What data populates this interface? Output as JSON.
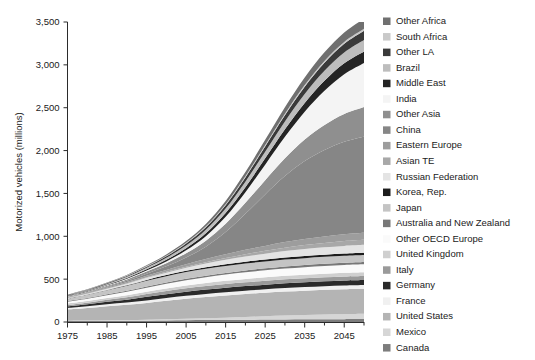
{
  "chart_data": {
    "type": "area",
    "title": "",
    "subtitle": "",
    "xlabel": "",
    "ylabel": "Motorized vehicles (millions)",
    "xlim": [
      1975,
      2050
    ],
    "ylim": [
      0,
      3500
    ],
    "grid": false,
    "legend_position": "right",
    "stacked": true,
    "x": [
      1975,
      1980,
      1985,
      1990,
      1995,
      2000,
      2005,
      2010,
      2015,
      2020,
      2025,
      2030,
      2035,
      2040,
      2045,
      2050
    ],
    "xticks": [
      1975,
      1985,
      1995,
      2005,
      2015,
      2025,
      2035,
      2045
    ],
    "xtick_labels": [
      "1975",
      "1985",
      "1995",
      "2005",
      "2015",
      "2025",
      "2035",
      "2045"
    ],
    "xminor_ticks": [
      1980,
      1990,
      2000,
      2010,
      2020,
      2030,
      2040,
      2050
    ],
    "yticks": [
      0,
      500,
      1000,
      1500,
      2000,
      2500,
      3000,
      3500
    ],
    "ytick_labels": [
      "0",
      "500",
      "1,000",
      "1,500",
      "2,000",
      "2,500",
      "3,000",
      "3,500"
    ],
    "total_top": [
      310,
      355,
      405,
      460,
      530,
      620,
      740,
      900,
      1120,
      1400,
      1720,
      2060,
      2400,
      2700,
      2950,
      3150
    ],
    "series": [
      {
        "name": "Canada",
        "color": "#7d7d7d",
        "values": [
          11,
          12,
          13,
          14,
          16,
          18,
          20,
          22,
          24,
          26,
          28,
          30,
          31,
          32,
          33,
          34
        ]
      },
      {
        "name": "Mexico",
        "color": "#d6d6d6",
        "values": [
          5,
          6,
          8,
          9,
          11,
          14,
          18,
          22,
          27,
          33,
          39,
          45,
          50,
          55,
          59,
          62
        ]
      },
      {
        "name": "United States",
        "color": "#b4b4b4",
        "values": [
          130,
          145,
          163,
          178,
          196,
          215,
          233,
          247,
          258,
          267,
          274,
          280,
          284,
          288,
          291,
          293
        ]
      },
      {
        "name": "France",
        "color": "#f0f0f0",
        "values": [
          17,
          20,
          23,
          26,
          29,
          32,
          34,
          36,
          38,
          39,
          40,
          41,
          42,
          42,
          43,
          43
        ]
      },
      {
        "name": "Germany",
        "color": "#2a2a2a",
        "values": [
          20,
          24,
          29,
          34,
          42,
          46,
          49,
          51,
          53,
          54,
          55,
          56,
          57,
          57,
          58,
          58
        ]
      },
      {
        "name": "Italy",
        "color": "#9a9a9a",
        "values": [
          16,
          19,
          23,
          27,
          32,
          36,
          39,
          41,
          43,
          44,
          45,
          46,
          46,
          47,
          47,
          47
        ]
      },
      {
        "name": "United Kingdom",
        "color": "#cfcfcf",
        "values": [
          16,
          18,
          21,
          24,
          27,
          30,
          33,
          35,
          37,
          39,
          40,
          41,
          42,
          43,
          43,
          44
        ]
      },
      {
        "name": "Other OECD Europe",
        "color": "#fafafa",
        "values": [
          22,
          27,
          33,
          40,
          47,
          55,
          62,
          68,
          73,
          78,
          82,
          85,
          88,
          90,
          92,
          93
        ]
      },
      {
        "name": "Australia and New Zealand",
        "color": "#787878",
        "values": [
          8,
          9,
          10,
          12,
          13,
          15,
          17,
          19,
          20,
          22,
          23,
          24,
          25,
          26,
          26,
          27
        ]
      },
      {
        "name": "Japan",
        "color": "#c4c4c4",
        "values": [
          28,
          38,
          48,
          58,
          68,
          73,
          77,
          79,
          80,
          80,
          80,
          80,
          80,
          80,
          80,
          80
        ]
      },
      {
        "name": "Korea, Rep.",
        "color": "#1c1c1c",
        "values": [
          1,
          2,
          3,
          6,
          10,
          13,
          16,
          18,
          20,
          22,
          23,
          24,
          25,
          25,
          26,
          26
        ]
      },
      {
        "name": "Russian Federation",
        "color": "#e4e4e4",
        "values": [
          7,
          10,
          14,
          19,
          24,
          29,
          36,
          44,
          52,
          60,
          68,
          75,
          81,
          86,
          90,
          93
        ]
      },
      {
        "name": "Asian TE",
        "color": "#a8a8a8",
        "values": [
          2,
          3,
          4,
          5,
          7,
          9,
          12,
          16,
          21,
          27,
          33,
          40,
          46,
          51,
          56,
          59
        ]
      },
      {
        "name": "Eastern Europe",
        "color": "#9d9d9d",
        "values": [
          6,
          8,
          11,
          14,
          18,
          23,
          29,
          36,
          43,
          51,
          58,
          65,
          71,
          76,
          80,
          83
        ]
      },
      {
        "name": "China",
        "color": "#868686",
        "values": [
          3,
          5,
          8,
          14,
          24,
          42,
          78,
          145,
          260,
          420,
          600,
          770,
          910,
          1010,
          1080,
          1120
        ]
      },
      {
        "name": "Other Asia",
        "color": "#8f8f8f",
        "values": [
          6,
          8,
          12,
          17,
          25,
          36,
          50,
          70,
          96,
          128,
          166,
          208,
          250,
          290,
          322,
          345
        ]
      },
      {
        "name": "India",
        "color": "#f4f4f4",
        "values": [
          2,
          3,
          5,
          8,
          13,
          21,
          33,
          52,
          82,
          125,
          182,
          250,
          325,
          400,
          465,
          515
        ]
      },
      {
        "name": "Middle East",
        "color": "#242424",
        "values": [
          3,
          4,
          6,
          9,
          13,
          18,
          25,
          34,
          45,
          58,
          73,
          88,
          103,
          116,
          127,
          135
        ]
      },
      {
        "name": "Brazil",
        "color": "#bdbdbd",
        "values": [
          5,
          7,
          10,
          13,
          18,
          24,
          31,
          40,
          51,
          64,
          78,
          92,
          105,
          117,
          126,
          133
        ]
      },
      {
        "name": "Other LA",
        "color": "#3a3a3a",
        "values": [
          4,
          5,
          7,
          10,
          13,
          18,
          24,
          31,
          40,
          50,
          61,
          72,
          83,
          93,
          101,
          107
        ]
      },
      {
        "name": "South Africa",
        "color": "#c9c9c9",
        "values": [
          3,
          4,
          4,
          5,
          6,
          7,
          8,
          10,
          12,
          14,
          16,
          18,
          20,
          22,
          23,
          24
        ]
      },
      {
        "name": "Other Africa",
        "color": "#707070",
        "values": [
          3,
          4,
          5,
          7,
          10,
          14,
          20,
          27,
          37,
          48,
          61,
          75,
          88,
          100,
          110,
          117
        ]
      }
    ]
  },
  "legend": {
    "items": [
      {
        "label": "Other Africa",
        "color": "#707070"
      },
      {
        "label": "South Africa",
        "color": "#c9c9c9"
      },
      {
        "label": "Other LA",
        "color": "#3a3a3a"
      },
      {
        "label": "Brazil",
        "color": "#bdbdbd"
      },
      {
        "label": "Middle East",
        "color": "#242424"
      },
      {
        "label": "India",
        "color": "#f4f4f4"
      },
      {
        "label": "Other Asia",
        "color": "#8f8f8f"
      },
      {
        "label": "China",
        "color": "#868686"
      },
      {
        "label": "Eastern Europe",
        "color": "#9d9d9d"
      },
      {
        "label": "Asian TE",
        "color": "#a8a8a8"
      },
      {
        "label": "Russian Federation",
        "color": "#e4e4e4"
      },
      {
        "label": "Korea, Rep.",
        "color": "#1c1c1c"
      },
      {
        "label": "Japan",
        "color": "#c4c4c4"
      },
      {
        "label": "Australia and New Zealand",
        "color": "#787878"
      },
      {
        "label": "Other OECD Europe",
        "color": "#fafafa"
      },
      {
        "label": "United Kingdom",
        "color": "#cfcfcf"
      },
      {
        "label": "Italy",
        "color": "#9a9a9a"
      },
      {
        "label": "Germany",
        "color": "#2a2a2a"
      },
      {
        "label": "France",
        "color": "#f0f0f0"
      },
      {
        "label": "United States",
        "color": "#b4b4b4"
      },
      {
        "label": "Mexico",
        "color": "#d6d6d6"
      },
      {
        "label": "Canada",
        "color": "#7d7d7d"
      }
    ]
  }
}
